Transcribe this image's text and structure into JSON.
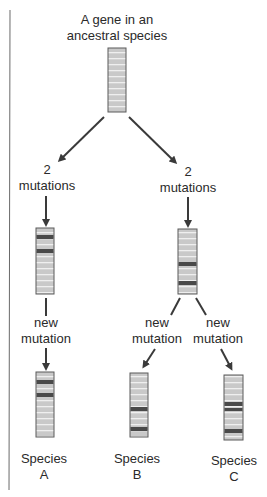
{
  "title": {
    "line1": "A gene in an",
    "line2": "ancestral species"
  },
  "branches": {
    "left": {
      "line1": "2",
      "line2": "mutations"
    },
    "right": {
      "line1": "2",
      "line2": "mutations"
    }
  },
  "events": {
    "a": {
      "line1": "new",
      "line2": "mutation"
    },
    "b": {
      "line1": "new",
      "line2": "mutation"
    },
    "c": {
      "line1": "new",
      "line2": "mutation"
    }
  },
  "species": {
    "a": {
      "line1": "Species",
      "line2": "A"
    },
    "b": {
      "line1": "Species",
      "line2": "B"
    },
    "c": {
      "line1": "Species",
      "line2": "C"
    }
  },
  "colors": {
    "gene_fill": "#c9c9c9",
    "gene_stripe": "#efefef",
    "gene_border": "#5a5a5a",
    "mutation_band": "#4a4a4a",
    "arrow": "#3a3a3a",
    "border_line": "#6a6a6a"
  },
  "genes": [
    {
      "id": "ancestral",
      "mutation_bands": []
    },
    {
      "id": "lineage-a-intermediate",
      "mutation_bands": [
        2,
        5
      ]
    },
    {
      "id": "lineage-bc-intermediate",
      "mutation_bands": [
        9,
        13
      ]
    },
    {
      "id": "species-a",
      "mutation_bands": [
        2,
        5
      ]
    },
    {
      "id": "species-b",
      "mutation_bands": [
        9,
        13
      ]
    },
    {
      "id": "species-c",
      "mutation_bands": [
        7,
        8,
        13
      ]
    }
  ]
}
